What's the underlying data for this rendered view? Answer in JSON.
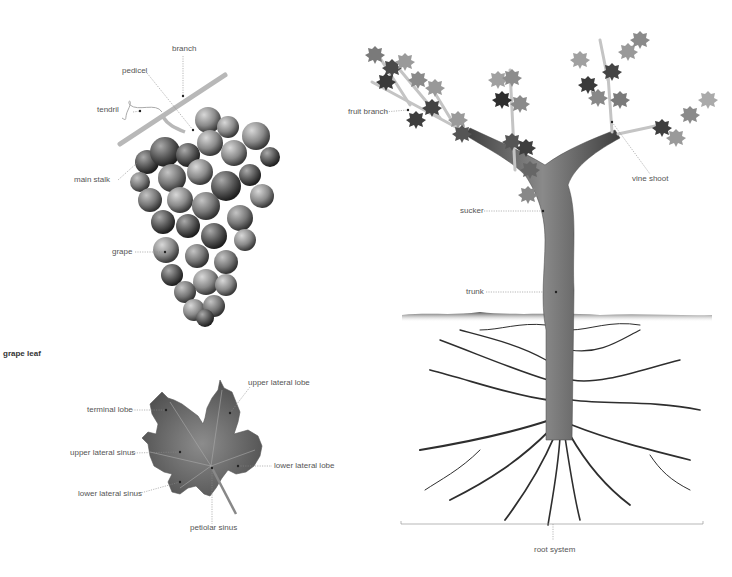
{
  "grape_cluster": {
    "labels": {
      "branch": "branch",
      "pedicel": "pedicel",
      "tendril": "tendril",
      "main_stalk": "main stalk",
      "grape": "grape"
    }
  },
  "grape_leaf": {
    "title": "grape leaf",
    "labels": {
      "terminal_lobe": "terminal lobe",
      "upper_lateral_lobe": "upper lateral lobe",
      "upper_lateral_sinus": "upper lateral sinus",
      "lower_lateral_lobe": "lower lateral lobe",
      "lower_lateral_sinus": "lower lateral sinus",
      "petiolar_sinus": "petiolar sinus"
    }
  },
  "vine": {
    "labels": {
      "fruit_branch": "fruit branch",
      "vine_shoot": "vine shoot",
      "sucker": "sucker",
      "trunk": "trunk",
      "root_system": "root system"
    }
  },
  "colors": {
    "label_text": "#555555",
    "leader_line": "#888888",
    "leaf_dark": "#4a4a4a",
    "leaf_mid": "#7a7a7a",
    "leaf_light": "#9a9a9a",
    "trunk": "#5e5e5e",
    "root": "#2e2e2e"
  }
}
